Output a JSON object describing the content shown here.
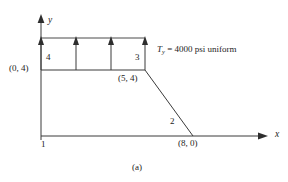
{
  "figure": {
    "caption": "(a)",
    "axes": {
      "x_label": "x",
      "y_label": "y"
    },
    "nodes": [
      {
        "id": "1",
        "label": "1",
        "coordinate_label": ""
      },
      {
        "id": "2",
        "label": "2",
        "coordinate_label": "(8, 0)"
      },
      {
        "id": "3",
        "label": "3",
        "coordinate_label": "(5, 4)"
      },
      {
        "id": "4",
        "label": "4",
        "coordinate_label": "(0, 4)"
      }
    ],
    "node_labels": {
      "n1": "1",
      "n2": "2",
      "n3": "3",
      "n4": "4"
    },
    "coordinate_labels": {
      "origin_top": "(0, 4)",
      "corner_mid": "(5, 4)",
      "base_right": "(8, 0)"
    },
    "load": {
      "symbol": "T",
      "subscript": "y",
      "equals": "=",
      "value": "4000",
      "units": "psi",
      "distribution": "uniform",
      "full_text": "T_y = 4000 psi uniform",
      "arrow_count": 4,
      "direction": "up"
    },
    "colors": {
      "line": "#3a3a3a",
      "load_line": "#4a4a4a",
      "text": "#1c1c1c",
      "background": "#ffffff"
    }
  }
}
